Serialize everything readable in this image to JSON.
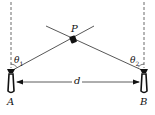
{
  "diagram": {
    "point_label": "P",
    "antenna_a_label": "A",
    "antenna_b_label": "B",
    "distance_label": "d",
    "angle_1": "θ",
    "angle_1_sub": "1",
    "angle_2": "θ",
    "angle_2_sub": "2",
    "line_color": "#333333"
  }
}
